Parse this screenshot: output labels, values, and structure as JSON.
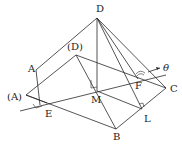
{
  "diagram": {
    "type": "geometry-folding-pyramid",
    "labels": {
      "D": "D",
      "D_orig": "(D)",
      "A": "A",
      "A_orig": "(A)",
      "E": "E",
      "M": "M",
      "F": "F",
      "C": "C",
      "B": "B",
      "L": "L",
      "theta": "θ"
    },
    "points": {
      "D": [
        97,
        18
      ],
      "D_orig": [
        73,
        55
      ],
      "A": [
        36,
        70
      ],
      "A_orig": [
        26,
        95
      ],
      "E": [
        47,
        103
      ],
      "M": [
        97,
        91
      ],
      "F": [
        138,
        79
      ],
      "C": [
        166,
        88
      ],
      "B": [
        116,
        129
      ],
      "L": [
        142,
        109
      ]
    },
    "annotations": [
      "right angle at M",
      "right angle at E",
      "right angle at L",
      "angle θ at F"
    ]
  }
}
